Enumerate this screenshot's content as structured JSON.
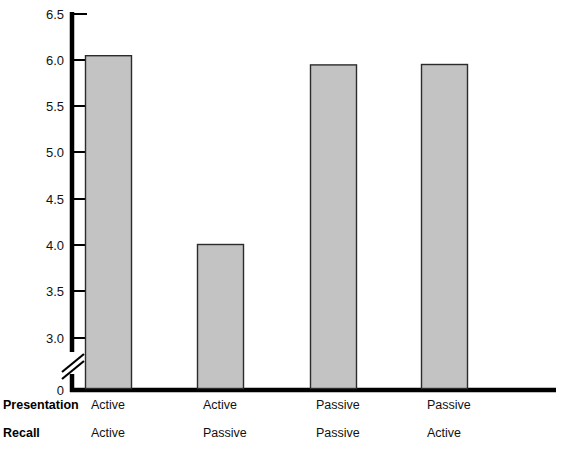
{
  "chart_data": {
    "type": "bar",
    "title": "",
    "subtitle": "",
    "xlabel": "",
    "ylabel": "",
    "ylim": [
      3.0,
      6.5
    ],
    "y_axis_break": true,
    "y_axis_break_note": "axis broken between 0 and 3.0",
    "grid": false,
    "legend": null,
    "yticks": [
      {
        "value": 6.5,
        "label": "6.5"
      },
      {
        "value": 6.0,
        "label": "6.0"
      },
      {
        "value": 5.5,
        "label": "5.5"
      },
      {
        "value": 5.0,
        "label": "5.0"
      },
      {
        "value": 4.5,
        "label": "4.5"
      },
      {
        "value": 4.0,
        "label": "4.0"
      },
      {
        "value": 3.5,
        "label": "3.5"
      },
      {
        "value": 3.0,
        "label": "3.0"
      }
    ],
    "origin_label": "0",
    "categories": [
      "Active / Active",
      "Active / Passive",
      "Passive / Passive",
      "Passive / Active"
    ],
    "values": [
      4.97,
      6.05,
      4.01,
      5.95
    ],
    "bar_fill_color": "#c3c3c3",
    "bar_edge_color": "#2b2b2b",
    "axis_color": "#000000",
    "background_color": "#ffffff"
  },
  "axis": {
    "row_headers": {
      "presentation": "Presentation",
      "recall": "Recall"
    },
    "presentation_values": [
      "Active",
      "Active",
      "Passive",
      "Passive"
    ],
    "recall_values": [
      "Active",
      "Passive",
      "Passive",
      "Active"
    ]
  }
}
